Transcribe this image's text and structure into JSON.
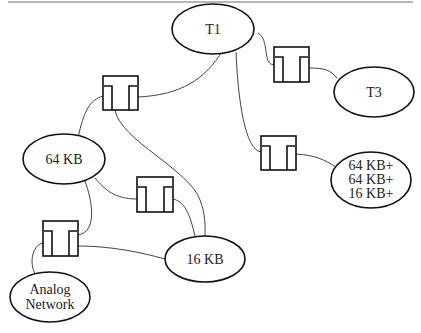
{
  "diagram": {
    "type": "network-topology",
    "nodes": [
      {
        "id": "t1",
        "label": "T1"
      },
      {
        "id": "t3",
        "label": "T3"
      },
      {
        "id": "kb64",
        "label": "64 KB"
      },
      {
        "id": "kb16",
        "label": "16 KB"
      },
      {
        "id": "mixed",
        "lines": [
          "64 KB+",
          "64 KB+",
          "16 KB+"
        ]
      },
      {
        "id": "analog",
        "lines": [
          "Analog",
          "Network"
        ]
      }
    ],
    "switches": [
      {
        "id": "sw1",
        "icon": "switch-icon"
      },
      {
        "id": "sw2",
        "icon": "switch-icon"
      },
      {
        "id": "sw3",
        "icon": "switch-icon"
      },
      {
        "id": "sw4",
        "icon": "switch-icon"
      },
      {
        "id": "sw5",
        "icon": "switch-icon"
      }
    ],
    "edges": [
      [
        "t1",
        "sw1"
      ],
      [
        "sw1",
        "kb64"
      ],
      [
        "sw1",
        "kb16"
      ],
      [
        "t1",
        "sw5"
      ],
      [
        "sw5",
        "t3"
      ],
      [
        "t1",
        "sw4"
      ],
      [
        "sw4",
        "mixed"
      ],
      [
        "kb64",
        "sw2"
      ],
      [
        "sw2",
        "kb16"
      ],
      [
        "kb64",
        "sw3"
      ],
      [
        "sw3",
        "kb16"
      ],
      [
        "sw3",
        "analog"
      ]
    ]
  }
}
